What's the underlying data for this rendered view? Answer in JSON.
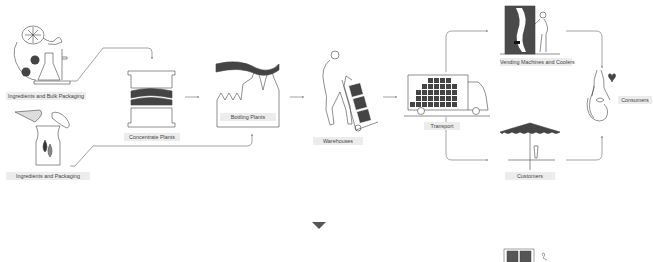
{
  "diagram": {
    "type": "supply-chain-flow",
    "colors": {
      "ink": "#3c3c3c",
      "fill": "#4a4a4a",
      "label_bg": "#ececec",
      "line": "#555555"
    },
    "nodes": [
      {
        "id": "ingredients_bulk",
        "label": "Ingredients and Bulk Packaging"
      },
      {
        "id": "ingredients_pack",
        "label": "Ingredients and Packaging"
      },
      {
        "id": "concentrate",
        "label": "Concentrate Plants"
      },
      {
        "id": "bottling",
        "label": "Bottling Plants"
      },
      {
        "id": "warehouses",
        "label": "Warehouses"
      },
      {
        "id": "transport",
        "label": "Transport"
      },
      {
        "id": "vending",
        "label": "Vending Machines and Coolers"
      },
      {
        "id": "customers",
        "label": "Customers"
      },
      {
        "id": "consumers",
        "label": "Consumers"
      }
    ],
    "edges": [
      {
        "from": "Ingredients and Bulk Packaging",
        "to": "Concentrate Plants"
      },
      {
        "from": "Ingredients and Packaging",
        "to": "Bottling Plants"
      },
      {
        "from": "Concentrate Plants",
        "to": "Bottling Plants"
      },
      {
        "from": "Bottling Plants",
        "to": "Warehouses"
      },
      {
        "from": "Warehouses",
        "to": "Transport"
      },
      {
        "from": "Transport",
        "to": "Vending Machines and Coolers"
      },
      {
        "from": "Transport",
        "to": "Customers"
      },
      {
        "from": "Vending Machines and Coolers",
        "to": "Consumers"
      },
      {
        "from": "Customers",
        "to": "Consumers"
      }
    ],
    "scroll_indicator": "down-triangle-icon"
  }
}
